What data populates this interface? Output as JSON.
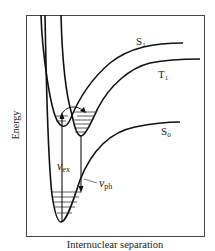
{
  "diagram": {
    "ylabel": "Energy",
    "xlabel": "Internuclear separation",
    "curves": {
      "s1": "S",
      "s1_sub": "1",
      "t1": "T",
      "t1_sub": "1",
      "s0": "S",
      "s0_sub": "0"
    },
    "transitions": {
      "excitation": "ν",
      "excitation_sub": "ex",
      "phosphorescence": "ν",
      "phosphorescence_sub": "ph"
    }
  }
}
